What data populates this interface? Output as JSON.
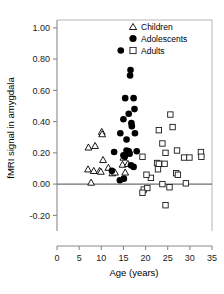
{
  "chart_data": {
    "type": "scatter",
    "title": "",
    "xlabel": "Age (years)",
    "ylabel": "fMRI signal in amygdala",
    "xlim": [
      0,
      35
    ],
    "ylim": [
      -0.3,
      1.05
    ],
    "xticks": [
      0,
      5,
      10,
      15,
      20,
      25,
      30,
      35
    ],
    "xticklabels": [
      "0",
      "5",
      "10",
      "15",
      "20",
      "25",
      "30",
      "35"
    ],
    "yticks": [
      -0.2,
      0.0,
      0.2,
      0.4,
      0.6,
      0.8,
      1.0
    ],
    "yticklabels": [
      "-0.20",
      "0.00",
      "0.20",
      "0.40",
      "0.60",
      "0.80",
      "1.00"
    ],
    "grid": false,
    "zero_line": 0.0,
    "legend_position": "top-right",
    "legend": [
      {
        "name": "Children",
        "marker": "open-triangle"
      },
      {
        "name": "Adolescents",
        "marker": "filled-circle"
      },
      {
        "name": "Adults",
        "marker": "open-square"
      }
    ],
    "series": [
      {
        "name": "Children",
        "marker": "open-triangle",
        "points": [
          [
            7.0,
            0.095
          ],
          [
            7.1,
            0.235
          ],
          [
            7.7,
            0.01
          ],
          [
            8.3,
            0.085
          ],
          [
            8.6,
            0.245
          ],
          [
            9.6,
            0.085
          ],
          [
            9.9,
            0.08
          ],
          [
            10.1,
            0.335
          ],
          [
            10.2,
            0.32
          ],
          [
            10.4,
            0.155
          ],
          [
            11.6,
            0.105
          ],
          [
            12.5,
            0.07
          ],
          [
            13.1,
            0.075
          ],
          [
            14.8,
            0.125
          ],
          [
            15.0,
            0.17
          ],
          [
            15.4,
            0.075
          ],
          [
            16.0,
            0.13
          ]
        ]
      },
      {
        "name": "Adolescents",
        "marker": "filled-circle",
        "points": [
          [
            14.4,
            0.855
          ],
          [
            16.6,
            0.73
          ],
          [
            16.5,
            0.695
          ],
          [
            15.4,
            0.55
          ],
          [
            17.3,
            0.55
          ],
          [
            17.5,
            0.48
          ],
          [
            16.2,
            0.45
          ],
          [
            15.0,
            0.415
          ],
          [
            16.8,
            0.39
          ],
          [
            16.9,
            0.37
          ],
          [
            14.3,
            0.325
          ],
          [
            17.6,
            0.325
          ],
          [
            15.7,
            0.285
          ],
          [
            12.9,
            0.205
          ],
          [
            15.7,
            0.215
          ],
          [
            16.2,
            0.21
          ],
          [
            16.4,
            0.195
          ],
          [
            18.0,
            0.21
          ],
          [
            15.0,
            0.185
          ],
          [
            15.3,
            0.175
          ],
          [
            12.4,
            0.085
          ],
          [
            16.7,
            0.12
          ],
          [
            17.3,
            0.11
          ],
          [
            14.2,
            0.025
          ],
          [
            15.1,
            0.035
          ]
        ]
      },
      {
        "name": "Adults",
        "marker": "open-square",
        "points": [
          [
            25.6,
            0.445
          ],
          [
            26.1,
            0.365
          ],
          [
            23.0,
            0.345
          ],
          [
            23.8,
            0.26
          ],
          [
            27.1,
            0.215
          ],
          [
            32.5,
            0.205
          ],
          [
            24.5,
            0.2
          ],
          [
            28.7,
            0.17
          ],
          [
            32.6,
            0.175
          ],
          [
            29.9,
            0.17
          ],
          [
            19.3,
            0.175
          ],
          [
            22.6,
            0.135
          ],
          [
            23.0,
            0.13
          ],
          [
            24.3,
            0.13
          ],
          [
            26.9,
            0.07
          ],
          [
            27.3,
            0.06
          ],
          [
            22.8,
            0.095
          ],
          [
            21.2,
            0.04
          ],
          [
            20.2,
            0.06
          ],
          [
            29.1,
            0.005
          ],
          [
            23.8,
            0.0
          ],
          [
            19.6,
            -0.035
          ],
          [
            20.4,
            -0.025
          ],
          [
            19.3,
            -0.055
          ],
          [
            25.4,
            -0.02
          ],
          [
            24.5,
            -0.135
          ]
        ]
      }
    ]
  }
}
